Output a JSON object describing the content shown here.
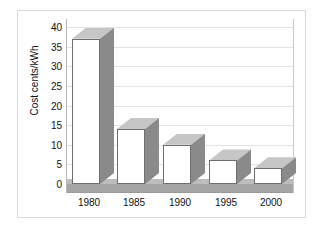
{
  "chart_data": {
    "type": "bar",
    "title": "",
    "xlabel": "",
    "ylabel": "Cost cents/kWh",
    "categories": [
      "1980",
      "1985",
      "1990",
      "1995",
      "2000"
    ],
    "values": [
      37,
      14,
      10,
      6,
      4
    ],
    "ylim": [
      0,
      40
    ],
    "yticks": [
      0,
      5,
      10,
      15,
      20,
      25,
      30,
      35,
      40
    ],
    "ytick_labels": [
      "0",
      "5",
      "10",
      "15",
      "20",
      "25",
      "30",
      "35",
      "40"
    ],
    "grid": true,
    "legend": "none",
    "style": "3d-column",
    "series": [
      {
        "name": "Cost",
        "values": [
          37,
          14,
          10,
          6,
          4
        ]
      }
    ],
    "annotations": []
  },
  "colors": {
    "bar_front": "#ffffff",
    "bar_side": "#8a8a8a",
    "bar_top": "#c6c6c6",
    "bar_outline": "#6f6f6f",
    "floor": "#a5a5a5",
    "floor_bevel": "#bdbdbd",
    "gridline": "#e2e2e2",
    "axis": "#9a9a9a",
    "frame": "#d8d8d8",
    "text": "#111111",
    "background": "#ffffff"
  }
}
